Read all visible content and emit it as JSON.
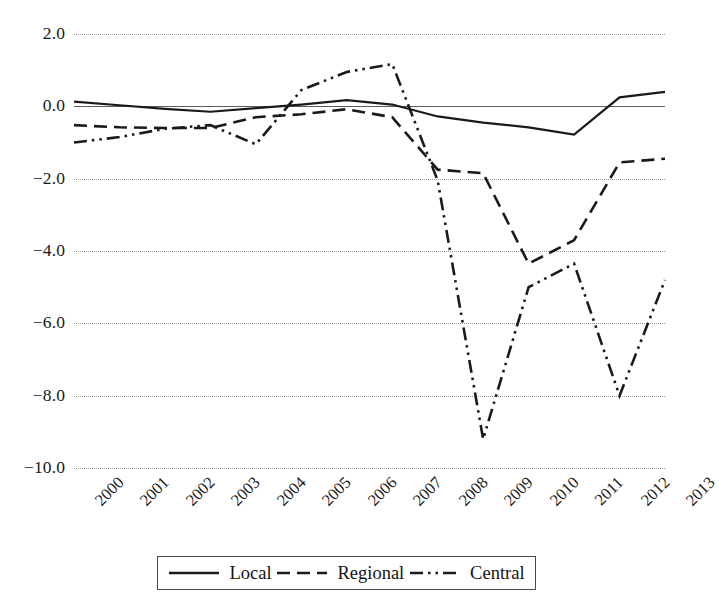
{
  "chart_data": {
    "type": "line",
    "title": "",
    "xlabel": "",
    "ylabel": "",
    "categories": [
      "2000",
      "2001",
      "2002",
      "2003",
      "2004",
      "2005",
      "2006",
      "2007",
      "2008",
      "2009",
      "2010",
      "2011",
      "2012",
      "2013"
    ],
    "ylim": [
      -10.0,
      2.0
    ],
    "yticks": [
      2.0,
      0.0,
      -2.0,
      -4.0,
      -6.0,
      -8.0,
      -10.0
    ],
    "ytick_labels": [
      "2.0",
      "0.0",
      "−2.0",
      "−4.0",
      "−6.0",
      "−8.0",
      "−10.0"
    ],
    "grid": true,
    "grid_style": "dotted-horizontal",
    "zero_line": true,
    "legend_position": "bottom",
    "series": [
      {
        "name": "Local",
        "style": "solid",
        "color": "#1a1a1a",
        "values": [
          0.13,
          0.03,
          -0.07,
          -0.15,
          -0.05,
          0.05,
          0.17,
          0.05,
          -0.28,
          -0.45,
          -0.58,
          -0.78,
          0.25,
          0.4
        ]
      },
      {
        "name": "Regional",
        "style": "dashed",
        "color": "#1a1a1a",
        "values": [
          -0.52,
          -0.58,
          -0.6,
          -0.6,
          -0.3,
          -0.22,
          -0.08,
          -0.3,
          -1.75,
          -1.85,
          -4.35,
          -3.7,
          -1.55,
          -1.45
        ]
      },
      {
        "name": "Central",
        "style": "dash-dot-dot",
        "color": "#1a1a1a",
        "values": [
          -1.0,
          -0.85,
          -0.62,
          -0.52,
          -1.05,
          0.45,
          0.95,
          1.17,
          -2.05,
          -9.2,
          -5.0,
          -4.35,
          -8.0,
          -4.8
        ]
      }
    ]
  },
  "legend": {
    "items": [
      {
        "label": "Local",
        "icon": "solid-line-swatch"
      },
      {
        "label": "Regional",
        "icon": "dashed-line-swatch"
      },
      {
        "label": "Central",
        "icon": "dash-dot-dot-line-swatch"
      }
    ]
  }
}
